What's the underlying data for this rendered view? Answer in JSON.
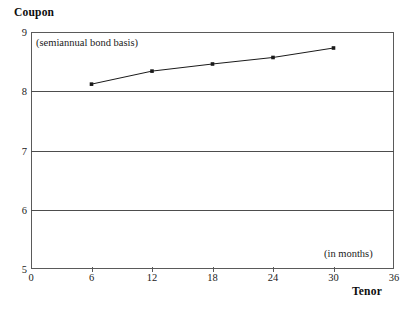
{
  "chart_data": {
    "type": "line",
    "title": "",
    "ylabel": "Coupon",
    "xlabel": "Tenor",
    "xlim": [
      0,
      36
    ],
    "ylim": [
      5,
      9
    ],
    "grid": true,
    "legend": "none",
    "x": [
      6,
      12,
      18,
      24,
      30
    ],
    "xticks": [
      0,
      6,
      12,
      18,
      24,
      30,
      36
    ],
    "yticks": [
      5,
      6,
      7,
      8,
      9
    ],
    "series": [
      {
        "name": "Coupon curve",
        "values": [
          8.12,
          8.34,
          8.46,
          8.57,
          8.73
        ],
        "color": "#1a1a1a",
        "marker": "square"
      }
    ],
    "annotations": [
      {
        "text": "(semiannual bond basis)",
        "x": 6,
        "y": 8.9
      },
      {
        "text": "(in months)",
        "x": 31,
        "y": 5.35
      }
    ],
    "xtick_labels": [
      "0",
      "6",
      "12",
      "18",
      "24",
      "30",
      "36"
    ],
    "ytick_labels": [
      "5",
      "6",
      "7",
      "8",
      "9"
    ]
  },
  "labels": {
    "y_axis_title": "Coupon",
    "x_axis_title": "Tenor",
    "note_basis": "(semiannual bond basis)",
    "note_units": "(in months)"
  },
  "colors": {
    "line": "#1a1a1a",
    "grid": "#4d4d4d",
    "frame": "#5a5a5a",
    "text": "#1a1a1a",
    "background": "#ffffff"
  }
}
